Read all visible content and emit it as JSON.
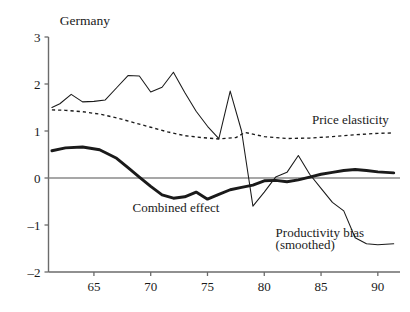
{
  "chart_data": {
    "type": "line",
    "title": "Germany",
    "xlabel": "",
    "ylabel": "",
    "xlim": [
      61.0,
      91.6
    ],
    "ylim": [
      -2,
      3
    ],
    "grid": false,
    "legend_position": "inline-annotations",
    "yticks": [
      -2,
      -1,
      0,
      1,
      2,
      3
    ],
    "ytick_labels": [
      "–2",
      "–1",
      "0",
      "1",
      "2",
      "3"
    ],
    "xticks": [
      65,
      70,
      75,
      80,
      85,
      90
    ],
    "xtick_labels": [
      "65",
      "70",
      "75",
      "80",
      "85",
      "90"
    ],
    "annotations": [
      {
        "text": "Germany",
        "x": 62.0,
        "y": 3.35,
        "name": "chart-title"
      },
      {
        "text": "Price elasticity",
        "x": 84.2,
        "y": 1.25,
        "name": "price-elasticity-label"
      },
      {
        "text": "Combined effect",
        "x": 68.4,
        "y": -0.62,
        "name": "combined-effect-label"
      },
      {
        "text": "Productivity bias",
        "x": 81.0,
        "y": -1.16,
        "name": "productivity-bias-label"
      },
      {
        "text": "(smoothed)",
        "x": 81.0,
        "y": -1.42,
        "name": "productivity-bias-sublabel"
      }
    ],
    "series": [
      {
        "name": "Productivity bias",
        "style": "thin-solid",
        "x": [
          61.3,
          62.0,
          63.0,
          64.0,
          65.0,
          66.0,
          67.0,
          68.0,
          69.0,
          70.0,
          71.0,
          72.0,
          73.0,
          74.0,
          75.0,
          76.0,
          77.0,
          78.0,
          79.0,
          80.0,
          81.0,
          82.0,
          83.0,
          84.0,
          85.0,
          86.0,
          87.0,
          88.0,
          89.0,
          90.0,
          91.4
        ],
        "values": [
          1.5,
          1.58,
          1.78,
          1.62,
          1.63,
          1.66,
          1.92,
          2.18,
          2.17,
          1.83,
          1.93,
          2.25,
          1.82,
          1.42,
          1.1,
          0.84,
          1.85,
          1.0,
          -0.6,
          -0.3,
          0.02,
          0.12,
          0.48,
          0.08,
          -0.22,
          -0.52,
          -0.7,
          -1.27,
          -1.4,
          -1.42,
          -1.4
        ]
      },
      {
        "name": "Price elasticity",
        "style": "dashed",
        "x": [
          61.3,
          62.5,
          64.0,
          65.5,
          67.0,
          68.5,
          70.0,
          71.5,
          73.0,
          74.5,
          76.0,
          77.5,
          78.3,
          80.0,
          82.0,
          84.0,
          86.0,
          88.0,
          90.0,
          91.4
        ],
        "values": [
          1.45,
          1.44,
          1.41,
          1.36,
          1.28,
          1.18,
          1.08,
          0.98,
          0.9,
          0.86,
          0.83,
          0.86,
          0.97,
          0.88,
          0.84,
          0.85,
          0.88,
          0.92,
          0.95,
          0.96
        ]
      },
      {
        "name": "Combined effect",
        "style": "thick-solid",
        "x": [
          61.3,
          62.5,
          64.0,
          65.5,
          67.0,
          68.0,
          69.0,
          70.0,
          71.0,
          72.0,
          73.0,
          74.0,
          75.0,
          76.0,
          77.0,
          78.0,
          79.0,
          80.0,
          81.0,
          82.0,
          83.0,
          84.0,
          85.0,
          86.0,
          87.0,
          88.0,
          89.0,
          90.0,
          91.4
        ],
        "values": [
          0.58,
          0.64,
          0.66,
          0.6,
          0.42,
          0.22,
          0.02,
          -0.18,
          -0.36,
          -0.43,
          -0.4,
          -0.3,
          -0.45,
          -0.35,
          -0.25,
          -0.2,
          -0.15,
          -0.06,
          -0.05,
          -0.08,
          -0.04,
          0.02,
          0.08,
          0.12,
          0.16,
          0.18,
          0.16,
          0.13,
          0.11
        ]
      }
    ]
  }
}
